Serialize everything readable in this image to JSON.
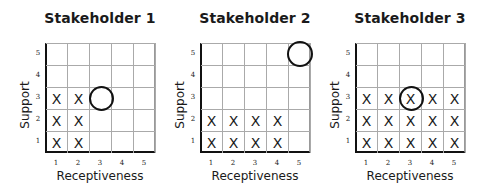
{
  "chart_data": [
    {
      "type": "scatter",
      "title": "Stakeholder 1",
      "xlabel": "Receptiveness",
      "ylabel": "Support",
      "x_ticks": [
        "1",
        "2",
        "3",
        "4",
        "5"
      ],
      "y_ticks": [
        "1",
        "2",
        "3",
        "4",
        "5"
      ],
      "xlim": [
        1,
        5
      ],
      "ylim": [
        1,
        5
      ],
      "grid": true,
      "x_marks": [
        [
          1,
          1
        ],
        [
          2,
          1
        ],
        [
          1,
          2
        ],
        [
          2,
          2
        ],
        [
          1,
          3
        ],
        [
          2,
          3
        ]
      ],
      "circle": [
        3,
        3
      ]
    },
    {
      "type": "scatter",
      "title": "Stakeholder 2",
      "xlabel": "Receptiveness",
      "ylabel": "Support",
      "x_ticks": [
        "1",
        "2",
        "3",
        "4",
        "5"
      ],
      "y_ticks": [
        "1",
        "2",
        "3",
        "4",
        "5"
      ],
      "xlim": [
        1,
        5
      ],
      "ylim": [
        1,
        5
      ],
      "grid": true,
      "x_marks": [
        [
          1,
          1
        ],
        [
          2,
          1
        ],
        [
          3,
          1
        ],
        [
          4,
          1
        ],
        [
          1,
          2
        ],
        [
          2,
          2
        ],
        [
          3,
          2
        ],
        [
          4,
          2
        ]
      ],
      "circle": [
        5,
        5
      ]
    },
    {
      "type": "scatter",
      "title": "Stakeholder 3",
      "xlabel": "Receptiveness",
      "ylabel": "Support",
      "x_ticks": [
        "1",
        "2",
        "3",
        "4",
        "5"
      ],
      "y_ticks": [
        "1",
        "2",
        "3",
        "4",
        "5"
      ],
      "xlim": [
        1,
        5
      ],
      "ylim": [
        1,
        5
      ],
      "grid": true,
      "x_marks": [
        [
          1,
          1
        ],
        [
          2,
          1
        ],
        [
          3,
          1
        ],
        [
          4,
          1
        ],
        [
          5,
          1
        ],
        [
          1,
          2
        ],
        [
          2,
          2
        ],
        [
          3,
          2
        ],
        [
          4,
          2
        ],
        [
          5,
          2
        ],
        [
          1,
          3
        ],
        [
          2,
          3
        ],
        [
          3,
          3
        ],
        [
          4,
          3
        ],
        [
          5,
          3
        ]
      ],
      "circle": [
        3,
        3
      ]
    }
  ],
  "mark_symbol": "X",
  "colors": {
    "line": "#111111",
    "grid": "#aaaaaa",
    "text": "#1a1a1a"
  }
}
